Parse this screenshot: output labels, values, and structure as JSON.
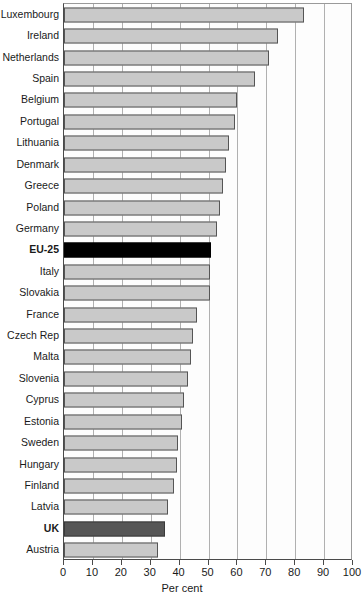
{
  "chart_data": {
    "type": "bar",
    "orientation": "horizontal",
    "title": "",
    "xlabel": "Per cent",
    "ylabel": "",
    "xlim": [
      0,
      100
    ],
    "xticks": [
      0,
      10,
      20,
      30,
      40,
      50,
      60,
      70,
      80,
      90,
      100
    ],
    "grid": true,
    "legend": null,
    "categories": [
      "Luxembourg",
      "Ireland",
      "Netherlands",
      "Spain",
      "Belgium",
      "Portugal",
      "Lithuania",
      "Denmark",
      "Greece",
      "Poland",
      "Germany",
      "EU-25",
      "Italy",
      "Slovakia",
      "France",
      "Czech Rep",
      "Malta",
      "Slovenia",
      "Cyprus",
      "Estonia",
      "Sweden",
      "Hungary",
      "Finland",
      "Latvia",
      "UK",
      "Austria"
    ],
    "values": [
      83,
      74,
      71,
      66,
      60,
      59,
      57,
      56,
      55,
      54,
      53,
      51,
      50.5,
      50.5,
      46,
      44.5,
      44,
      43,
      41.5,
      41,
      39.5,
      39,
      38,
      36,
      35,
      32.5
    ],
    "highlights": {
      "EU-25": "black",
      "UK": "dark"
    },
    "colors": {
      "bar_fill": "#c9c9c9",
      "bar_border": "#555555",
      "highlight_black": "#000000",
      "highlight_dark": "#565656",
      "gridline": "#b0b0b0",
      "axis": "#4a4a4a",
      "text": "#1a1a1a",
      "plot_background": "#fdfdfd"
    }
  }
}
